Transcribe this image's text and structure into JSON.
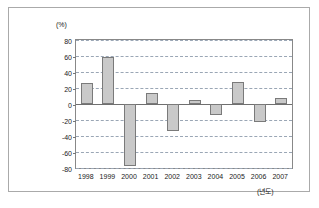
{
  "figure": {
    "y_unit_label": "(%)",
    "x_unit_label": "(년도)",
    "caption": ""
  },
  "chart_data": {
    "type": "bar",
    "title": "",
    "xlabel": "(년도)",
    "ylabel": "(%)",
    "categories": [
      "1998",
      "1999",
      "2000",
      "2001",
      "2002",
      "2003",
      "2004",
      "2005",
      "2006",
      "2007"
    ],
    "values": [
      26,
      59,
      -77,
      14,
      -34,
      5,
      -14,
      28,
      -22,
      7
    ],
    "ylim": [
      -80,
      80
    ],
    "yticks": [
      80,
      60,
      40,
      20,
      0,
      -20,
      -40,
      -60,
      -80
    ],
    "ytick_labels": [
      "80",
      "60",
      "40",
      "20",
      "0",
      "-20",
      "-40",
      "-60",
      "-80"
    ],
    "grid": true,
    "legend": false,
    "bar_color": "#c9c9c9",
    "bar_border_color": "#7a7a7a",
    "gridline_color": "#9aa6b5",
    "axis_color": "#888888"
  }
}
